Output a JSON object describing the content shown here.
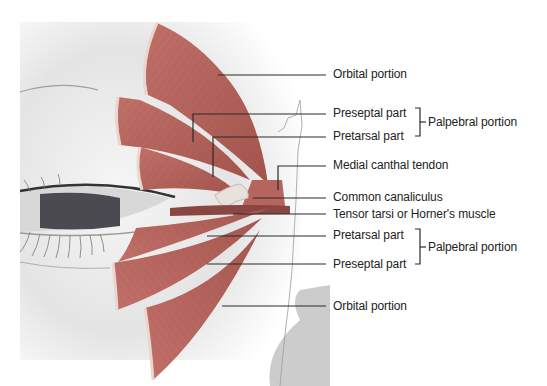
{
  "figure": {
    "colors": {
      "muscle": "#b8675e",
      "muscle_dark": "#9e5049",
      "muscle_edge": "#e9d3cc",
      "skin": "#e6e6e6",
      "background": "#ffffff",
      "leader_line": "#2a2a2a",
      "text": "#222222"
    }
  },
  "labels": [
    {
      "id": "orbital-upper",
      "text": "Orbital portion",
      "x": 333,
      "y": 67
    },
    {
      "id": "preseptal-upper",
      "text": "Preseptal part",
      "x": 333,
      "y": 106
    },
    {
      "id": "pretarsal-upper",
      "text": "Pretarsal part",
      "x": 333,
      "y": 129
    },
    {
      "id": "palpebral-upper",
      "text": "Palpebral portion",
      "x": 427,
      "y": 117
    },
    {
      "id": "medial-canthal",
      "text": "Medial canthal tendon",
      "x": 333,
      "y": 159
    },
    {
      "id": "common-canaliculus",
      "text": "Common canaliculus",
      "x": 333,
      "y": 188
    },
    {
      "id": "tensor-tarsi",
      "text": "Tensor tarsi or Horner's muscle",
      "x": 333,
      "y": 207
    },
    {
      "id": "pretarsal-lower",
      "text": "Pretarsal part",
      "x": 333,
      "y": 228
    },
    {
      "id": "preseptal-lower",
      "text": "Preseptal part",
      "x": 333,
      "y": 257
    },
    {
      "id": "palpebral-lower",
      "text": "Palpebral portion",
      "x": 427,
      "y": 242
    },
    {
      "id": "orbital-lower",
      "text": "Orbital portion",
      "x": 333,
      "y": 299
    }
  ]
}
